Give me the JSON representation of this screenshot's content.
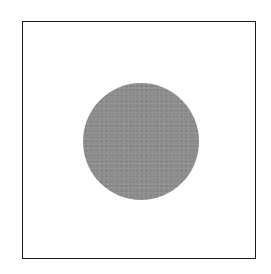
{
  "diagram": {
    "frame": {
      "shape": "square",
      "stroke_color": "#1a1a1a",
      "fill_color": "#ffffff"
    },
    "disc": {
      "shape": "circle",
      "fill_color": "#8a8a8a",
      "texture": "speckled"
    }
  }
}
